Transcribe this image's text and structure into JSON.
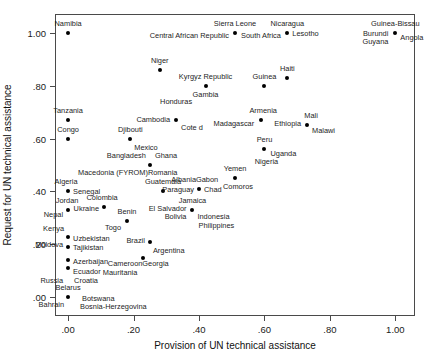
{
  "chart_data": {
    "type": "scatter",
    "title": "",
    "xlabel": "Provision of UN technical assistance",
    "ylabel": "Request for UN technical assistance",
    "xlim": [
      -0.04,
      1.06
    ],
    "ylim": [
      -0.07,
      1.07
    ],
    "grid": false,
    "legend": "none",
    "xticks": [
      ".00",
      ".20",
      ".40",
      ".60",
      ".80",
      "1.00"
    ],
    "xtick_values": [
      0.0,
      0.2,
      0.4,
      0.6,
      0.8,
      1.0
    ],
    "yticks": [
      ".00",
      ".20",
      ".40",
      ".60",
      ".80",
      "1.00"
    ],
    "ytick_values": [
      0.0,
      0.2,
      0.4,
      0.6,
      0.8,
      1.0
    ],
    "points": [
      {
        "x": 0.0,
        "y": 1.0,
        "labels": [
          {
            "text": "Namibia",
            "dx": 0,
            "dy": -9,
            "anchor": "mid"
          }
        ]
      },
      {
        "x": 0.51,
        "y": 1.0,
        "labels": [
          {
            "text": "Sierra Leone",
            "dx": 0,
            "dy": -9,
            "anchor": "mid"
          },
          {
            "text": "Central African Republic",
            "dx": -6,
            "dy": 3,
            "anchor": "end"
          },
          {
            "text": "South Africa",
            "dx": 6,
            "dy": 3,
            "anchor": "start"
          }
        ]
      },
      {
        "x": 0.67,
        "y": 1.0,
        "labels": [
          {
            "text": "Nicaragua",
            "dx": 0,
            "dy": -9,
            "anchor": "mid"
          },
          {
            "text": "Lesotho",
            "dx": 5,
            "dy": 1,
            "anchor": "start"
          }
        ]
      },
      {
        "x": 1.0,
        "y": 1.0,
        "labels": [
          {
            "text": "Guinea-Bissau",
            "dx": 0,
            "dy": -9,
            "anchor": "mid"
          },
          {
            "text": "Burundi",
            "dx": -7,
            "dy": 1,
            "anchor": "end"
          },
          {
            "text": "Angola",
            "dx": 5,
            "dy": 5,
            "anchor": "start"
          },
          {
            "text": "Guyana",
            "dx": -7,
            "dy": 9,
            "anchor": "end"
          }
        ]
      },
      {
        "x": 0.28,
        "y": 0.86,
        "labels": [
          {
            "text": "Niger",
            "dx": 0,
            "dy": -9,
            "anchor": "mid"
          }
        ]
      },
      {
        "x": 0.42,
        "y": 0.8,
        "labels": [
          {
            "text": "Kyrgyz Republic",
            "dx": 0,
            "dy": -9,
            "anchor": "mid"
          },
          {
            "text": "Gambia",
            "dx": 0,
            "dy": 9,
            "anchor": "mid"
          }
        ]
      },
      {
        "x": 0.6,
        "y": 0.8,
        "labels": [
          {
            "text": "Guinea",
            "dx": 0,
            "dy": -9,
            "anchor": "mid"
          }
        ]
      },
      {
        "x": 0.67,
        "y": 0.83,
        "labels": [
          {
            "text": "Haiti",
            "dx": 0,
            "dy": -9,
            "anchor": "mid"
          }
        ]
      },
      {
        "x": 0.33,
        "y": 0.67,
        "labels": [
          {
            "text": "Honduras",
            "dx": 0,
            "dy": -18,
            "anchor": "mid"
          },
          {
            "text": "Cambodia",
            "dx": -6,
            "dy": 0,
            "anchor": "end"
          },
          {
            "text": "Cote d",
            "dx": 5,
            "dy": 8,
            "anchor": "start"
          }
        ]
      },
      {
        "x": 0.0,
        "y": 0.67,
        "labels": [
          {
            "text": "Tanzania",
            "dx": 0,
            "dy": -9,
            "anchor": "mid"
          }
        ]
      },
      {
        "x": 0.0,
        "y": 0.6,
        "labels": [
          {
            "text": "Congo",
            "dx": 0,
            "dy": -9,
            "anchor": "mid"
          }
        ]
      },
      {
        "x": 0.19,
        "y": 0.6,
        "labels": [
          {
            "text": "Djibouti",
            "dx": 0,
            "dy": -9,
            "anchor": "mid"
          },
          {
            "text": "Mexico",
            "dx": 4,
            "dy": 9,
            "anchor": "start"
          }
        ]
      },
      {
        "x": 0.59,
        "y": 0.67,
        "labels": [
          {
            "text": "Armenia",
            "dx": 2,
            "dy": -9,
            "anchor": "mid"
          },
          {
            "text": "Madagascar",
            "dx": -7,
            "dy": 4,
            "anchor": "end"
          }
        ]
      },
      {
        "x": 0.73,
        "y": 0.65,
        "labels": [
          {
            "text": "Mali",
            "dx": 4,
            "dy": -9,
            "anchor": "mid"
          },
          {
            "text": "Ethiopia",
            "dx": -6,
            "dy": -1,
            "anchor": "end"
          },
          {
            "text": "Malawi",
            "dx": 5,
            "dy": 6,
            "anchor": "start"
          }
        ]
      },
      {
        "x": 0.6,
        "y": 0.56,
        "labels": [
          {
            "text": "Peru",
            "dx": 0,
            "dy": -9,
            "anchor": "mid"
          },
          {
            "text": "Uganda",
            "dx": 6,
            "dy": 5,
            "anchor": "start"
          },
          {
            "text": "Nigeria",
            "dx": 2,
            "dy": 13,
            "anchor": "mid"
          }
        ]
      },
      {
        "x": 0.25,
        "y": 0.5,
        "labels": [
          {
            "text": "Bangladesh",
            "dx": -4,
            "dy": -9,
            "anchor": "end"
          },
          {
            "text": "Ghana",
            "dx": 5,
            "dy": -9,
            "anchor": "start"
          },
          {
            "text": "Macedonia (FYROM)",
            "dx": -2,
            "dy": 8,
            "anchor": "end"
          },
          {
            "text": "Romania",
            "dx": -2,
            "dy": 8,
            "anchor": "start"
          }
        ]
      },
      {
        "x": 0.51,
        "y": 0.45,
        "labels": [
          {
            "text": "Yemen",
            "dx": 0,
            "dy": -9,
            "anchor": "mid"
          },
          {
            "text": "Comoros",
            "dx": 3,
            "dy": 9,
            "anchor": "mid"
          }
        ]
      },
      {
        "x": 0.0,
        "y": 0.4,
        "labels": [
          {
            "text": "Algeria",
            "dx": -2,
            "dy": -9,
            "anchor": "mid"
          },
          {
            "text": "Senegal",
            "dx": 5,
            "dy": 1,
            "anchor": "start"
          }
        ]
      },
      {
        "x": 0.29,
        "y": 0.4,
        "labels": [
          {
            "text": "Guatemala",
            "dx": 0,
            "dy": -9,
            "anchor": "mid"
          }
        ]
      },
      {
        "x": 0.4,
        "y": 0.41,
        "labels": [
          {
            "text": "Albania",
            "dx": -3,
            "dy": -9,
            "anchor": "end"
          },
          {
            "text": "Gabon",
            "dx": -3,
            "dy": -9,
            "anchor": "start"
          },
          {
            "text": "Paraguay",
            "dx": -5,
            "dy": 1,
            "anchor": "end"
          },
          {
            "text": "Chad",
            "dx": 5,
            "dy": 1,
            "anchor": "start"
          }
        ]
      },
      {
        "x": 0.0,
        "y": 0.33,
        "labels": [
          {
            "text": "Jordan",
            "dx": -1,
            "dy": -9,
            "anchor": "mid"
          },
          {
            "text": "Nepal",
            "dx": -5,
            "dy": 5,
            "anchor": "end"
          }
        ]
      },
      {
        "x": 0.11,
        "y": 0.34,
        "labels": [
          {
            "text": "Colombia",
            "dx": -2,
            "dy": -9,
            "anchor": "mid"
          },
          {
            "text": "Ukraine",
            "dx": -5,
            "dy": 2,
            "anchor": "end"
          }
        ]
      },
      {
        "x": 0.38,
        "y": 0.33,
        "labels": [
          {
            "text": "Jamaica",
            "dx": 0,
            "dy": -9,
            "anchor": "mid"
          },
          {
            "text": "El Salvador",
            "dx": -6,
            "dy": -1,
            "anchor": "end"
          },
          {
            "text": "Indonesia",
            "dx": 5,
            "dy": 7,
            "anchor": "start"
          },
          {
            "text": "Bolivia",
            "dx": -6,
            "dy": 7,
            "anchor": "end"
          },
          {
            "text": "Philippines",
            "dx": 6,
            "dy": 16,
            "anchor": "start"
          }
        ]
      },
      {
        "x": 0.18,
        "y": 0.29,
        "labels": [
          {
            "text": "Benin",
            "dx": 0,
            "dy": -9,
            "anchor": "mid"
          },
          {
            "text": "Togo",
            "dx": -6,
            "dy": 7,
            "anchor": "end"
          }
        ]
      },
      {
        "x": 0.0,
        "y": 0.23,
        "labels": [
          {
            "text": "Kenya",
            "dx": -4,
            "dy": -8,
            "anchor": "end"
          },
          {
            "text": "Uzbekistan",
            "dx": 5,
            "dy": 2,
            "anchor": "start"
          },
          {
            "text": "Moldova",
            "dx": -5,
            "dy": 8,
            "anchor": "end"
          }
        ]
      },
      {
        "x": 0.25,
        "y": 0.21,
        "labels": [
          {
            "text": "Brazil",
            "dx": -5,
            "dy": -1,
            "anchor": "end"
          },
          {
            "text": "Argentina",
            "dx": 3,
            "dy": 9,
            "anchor": "start"
          }
        ]
      },
      {
        "x": 0.0,
        "y": 0.19,
        "labels": [
          {
            "text": "Tajikistan",
            "dx": 5,
            "dy": 1,
            "anchor": "start"
          }
        ]
      },
      {
        "x": 0.23,
        "y": 0.15,
        "labels": [
          {
            "text": "Cameroon",
            "dx": -1,
            "dy": 6,
            "anchor": "end"
          },
          {
            "text": "Georgia",
            "dx": -1,
            "dy": 6,
            "anchor": "start"
          },
          {
            "text": "Mauritania",
            "dx": -6,
            "dy": 15,
            "anchor": "end"
          }
        ]
      },
      {
        "x": 0.0,
        "y": 0.14,
        "labels": [
          {
            "text": "Azerbaijan",
            "dx": 5,
            "dy": 2,
            "anchor": "start"
          }
        ]
      },
      {
        "x": 0.0,
        "y": 0.11,
        "labels": [
          {
            "text": "Ecuador",
            "dx": 5,
            "dy": 4,
            "anchor": "start"
          },
          {
            "text": "Russia",
            "dx": -5,
            "dy": 13,
            "anchor": "end"
          },
          {
            "text": "Croatia",
            "dx": 6,
            "dy": 13,
            "anchor": "start"
          }
        ]
      },
      {
        "x": 0.0,
        "y": 0.0,
        "labels": [
          {
            "text": "Belarus",
            "dx": 0,
            "dy": -9,
            "anchor": "mid"
          },
          {
            "text": "Bahrain",
            "dx": -4,
            "dy": 8,
            "anchor": "end"
          },
          {
            "text": "Botswana",
            "dx": 14,
            "dy": 2,
            "anchor": "start"
          },
          {
            "text": "Bosnia-Herzegovina",
            "dx": 12,
            "dy": 10,
            "anchor": "start"
          }
        ]
      }
    ]
  }
}
